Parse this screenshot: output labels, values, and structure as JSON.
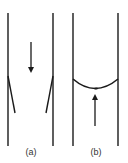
{
  "figure": {
    "colors": {
      "line": "#1a1a1a",
      "label": "#333333",
      "background": "#ffffff"
    },
    "panels": [
      {
        "id": "a",
        "label": "(a)",
        "description": "Tube walls with inward-angled flaps; arrow pointing down",
        "arrow_direction": "down",
        "feature": "flaps"
      },
      {
        "id": "b",
        "label": "(b)",
        "description": "Tube walls with curved meniscus; arrow pointing up",
        "arrow_direction": "up",
        "feature": "meniscus"
      }
    ]
  }
}
